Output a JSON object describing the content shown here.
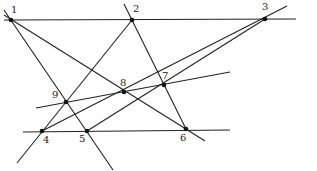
{
  "diagram": {
    "title": "",
    "points": [
      {
        "label": "1",
        "x": 11,
        "y": 20,
        "lx": 11,
        "ly": 13
      },
      {
        "label": "2",
        "x": 132,
        "y": 20,
        "lx": 133,
        "ly": 12
      },
      {
        "label": "3",
        "x": 265,
        "y": 19,
        "lx": 262,
        "ly": 10
      },
      {
        "label": "4",
        "x": 42,
        "y": 131,
        "lx": 43,
        "ly": 143
      },
      {
        "label": "5",
        "x": 87,
        "y": 131,
        "lx": 79,
        "ly": 142
      },
      {
        "label": "6",
        "x": 186,
        "y": 129,
        "lx": 180,
        "ly": 141
      },
      {
        "label": "7",
        "x": 164,
        "y": 85,
        "lx": 162,
        "ly": 79
      },
      {
        "label": "8",
        "x": 124,
        "y": 92,
        "lx": 120,
        "ly": 86
      },
      {
        "label": "9",
        "x": 66,
        "y": 102,
        "lx": 52,
        "ly": 98
      }
    ],
    "lines": [
      {
        "name": "line-1-2-3",
        "x1": 4,
        "y1": 20,
        "x2": 296,
        "y2": 19
      },
      {
        "name": "line-4-5-6",
        "x1": 23,
        "y1": 132,
        "x2": 230,
        "y2": 130
      },
      {
        "name": "line-9-8-7",
        "x1": 36,
        "y1": 108,
        "x2": 230,
        "y2": 72
      },
      {
        "name": "line-1-9-5",
        "x1": 4,
        "y1": 10,
        "x2": 113,
        "y2": 170
      },
      {
        "name": "line-1-8-6",
        "x1": 4,
        "y1": 15,
        "x2": 205,
        "y2": 141
      },
      {
        "name": "line-2-9-4",
        "x1": 132,
        "y1": 20,
        "x2": 17,
        "y2": 163
      },
      {
        "name": "line-2-7-6",
        "x1": 124,
        "y1": 4,
        "x2": 186,
        "y2": 129
      },
      {
        "name": "line-3-8-4",
        "x1": 287,
        "y1": 6,
        "x2": 42,
        "y2": 131
      },
      {
        "name": "line-3-7-5",
        "x1": 265,
        "y1": 19,
        "x2": 87,
        "y2": 131
      }
    ]
  }
}
